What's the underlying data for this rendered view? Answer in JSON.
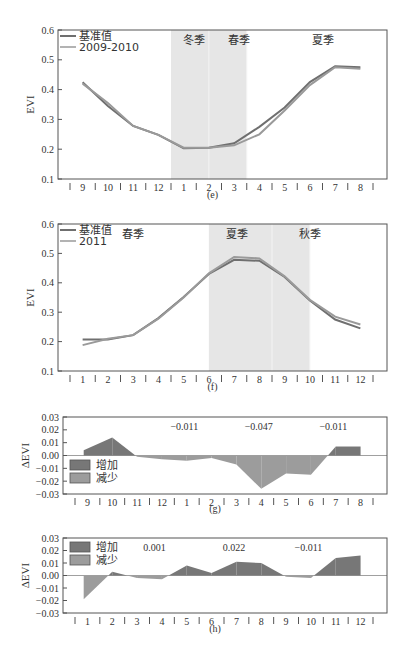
{
  "colors": {
    "baseline_line": "#6f6f6f",
    "compare_line": "#9a9a9a",
    "season_shade": "#e6e6e6",
    "increase_fill": "#777777",
    "decrease_fill": "#9c9c9c",
    "axis": "#555555"
  },
  "chart_data": [
    {
      "id": "e",
      "type": "line",
      "caption": "(e)",
      "ylabel": "EVI",
      "ylim": [
        0.1,
        0.6
      ],
      "yticks": [
        "0.1",
        "0.2",
        "0.3",
        "0.4",
        "0.5",
        "0.6"
      ],
      "categories": [
        "9",
        "10",
        "11",
        "12",
        "1",
        "2",
        "3",
        "4",
        "5",
        "6",
        "7",
        "8"
      ],
      "legend": [
        "基准值",
        "2009-2010"
      ],
      "seasons": [
        {
          "label": "冬季",
          "from": 4,
          "to": 5.5,
          "shaded": true
        },
        {
          "label": "春季",
          "from": 5.5,
          "to": 7,
          "shaded": true
        },
        {
          "label": "夏季",
          "from": 9,
          "to": 11,
          "shaded": false
        }
      ],
      "series": [
        {
          "name": "基准值",
          "values": [
            0.425,
            0.345,
            0.278,
            0.248,
            0.203,
            0.205,
            0.22,
            0.275,
            0.34,
            0.425,
            0.478,
            0.475
          ]
        },
        {
          "name": "2009-2010",
          "values": [
            0.42,
            0.355,
            0.278,
            0.248,
            0.205,
            0.205,
            0.213,
            0.25,
            0.33,
            0.415,
            0.475,
            0.47
          ]
        }
      ]
    },
    {
      "id": "f",
      "type": "line",
      "caption": "(f)",
      "ylabel": "EVI",
      "ylim": [
        0.1,
        0.6
      ],
      "yticks": [
        "0.1",
        "0.2",
        "0.3",
        "0.4",
        "0.5",
        "0.6"
      ],
      "categories": [
        "1",
        "2",
        "3",
        "4",
        "5",
        "6",
        "7",
        "8",
        "9",
        "10",
        "11",
        "12"
      ],
      "legend": [
        "基准值",
        "2011"
      ],
      "seasons": [
        {
          "label": "春季",
          "from": 0,
          "to": 5.5,
          "shaded": false
        },
        {
          "label": "夏季",
          "from": 5.5,
          "to": 8,
          "shaded": true
        },
        {
          "label": "秋季",
          "from": 8,
          "to": 9.5,
          "shaded": true
        }
      ],
      "series": [
        {
          "name": "基准值",
          "values": [
            0.207,
            0.207,
            0.222,
            0.28,
            0.352,
            0.43,
            0.478,
            0.475,
            0.42,
            0.34,
            0.275,
            0.245
          ]
        },
        {
          "name": "2011",
          "values": [
            0.188,
            0.21,
            0.222,
            0.278,
            0.35,
            0.432,
            0.488,
            0.483,
            0.422,
            0.342,
            0.285,
            0.258
          ]
        }
      ]
    },
    {
      "id": "g",
      "type": "area",
      "caption": "(g)",
      "ylabel": "ΔEVI",
      "ylim": [
        -0.03,
        0.03
      ],
      "yticks": [
        "0.03",
        "0.02",
        "0.01",
        "0.00",
        "−0.01",
        "−0.02",
        "−0.03"
      ],
      "categories": [
        "9",
        "10",
        "11",
        "12",
        "1",
        "2",
        "3",
        "4",
        "5",
        "6",
        "7",
        "8"
      ],
      "legend": [
        "增加",
        "减少"
      ],
      "annotations": [
        {
          "text": "−0.011",
          "at": 4.4
        },
        {
          "text": "−0.047",
          "at": 7.4
        },
        {
          "text": "−0.011",
          "at": 10.4
        }
      ],
      "values": [
        0.004,
        0.014,
        -0.001,
        -0.003,
        -0.004,
        -0.002,
        -0.007,
        -0.026,
        -0.014,
        -0.015,
        0.007,
        0.007
      ]
    },
    {
      "id": "h",
      "type": "area",
      "caption": "(h)",
      "ylabel": "ΔEVI",
      "ylim": [
        -0.03,
        0.03
      ],
      "yticks": [
        "0.03",
        "0.02",
        "0.01",
        "0.00",
        "−0.01",
        "−0.02",
        "−0.03"
      ],
      "categories": [
        "1",
        "2",
        "3",
        "4",
        "5",
        "6",
        "7",
        "8",
        "9",
        "10",
        "11",
        "12"
      ],
      "legend": [
        "增加",
        "减少"
      ],
      "annotations": [
        {
          "text": "0.001",
          "at": 3.2
        },
        {
          "text": "0.022",
          "at": 6.4
        },
        {
          "text": "−0.011",
          "at": 9.4
        }
      ],
      "values": [
        -0.019,
        0.003,
        -0.002,
        -0.003,
        0.008,
        0.002,
        0.011,
        0.01,
        -0.001,
        -0.002,
        0.014,
        0.016
      ]
    }
  ]
}
